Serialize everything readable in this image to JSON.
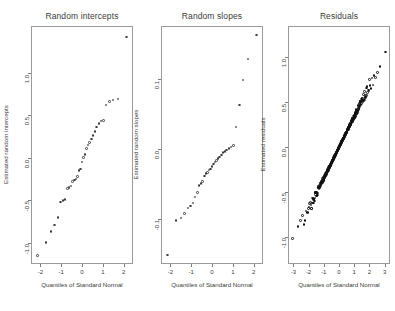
{
  "figure": {
    "background": "#ffffff",
    "point_color": "#3a3a3a",
    "axis_color": "#9a9a9a",
    "text_color": "#3b3b3b",
    "width": 395,
    "height": 311,
    "panel_count": 3
  },
  "chart_data": [
    {
      "type": "scatter",
      "title": "Random intercepts",
      "xlabel": "Quantiles of Standard Normal",
      "ylabel": "Estimated random intercepts",
      "grid": false,
      "legend": "none",
      "xlim": [
        -2.45,
        2.45
      ],
      "ylim": [
        -1.25,
        1.55
      ],
      "xticks": [
        -2,
        -1,
        0,
        1,
        2
      ],
      "xticklabels": [
        "-2",
        "-1",
        "0",
        "1",
        "2"
      ],
      "yticks": [
        -1.0,
        -0.5,
        0.0,
        0.5,
        1.0
      ],
      "yticklabels": [
        "-1.0",
        "-0.5",
        "0.0",
        "0.5",
        "1.0"
      ],
      "x": [
        -2.13,
        -1.73,
        -1.49,
        -1.31,
        -1.16,
        -1.03,
        -0.92,
        -0.81,
        -0.71,
        -0.62,
        -0.53,
        -0.45,
        -0.37,
        -0.29,
        -0.21,
        -0.14,
        -0.07,
        0.0,
        0.07,
        0.14,
        0.21,
        0.29,
        0.37,
        0.45,
        0.53,
        0.62,
        0.71,
        0.81,
        0.92,
        1.03,
        1.16,
        1.31,
        1.49,
        1.73,
        2.13
      ],
      "y": [
        -1.15,
        -1.0,
        -0.87,
        -0.79,
        -0.7,
        -0.52,
        -0.5,
        -0.49,
        -0.36,
        -0.35,
        -0.33,
        -0.28,
        -0.26,
        -0.25,
        -0.22,
        -0.15,
        -0.13,
        -0.05,
        0.0,
        0.04,
        0.11,
        0.15,
        0.18,
        0.22,
        0.26,
        0.31,
        0.36,
        0.4,
        0.43,
        0.44,
        0.62,
        0.66,
        0.68,
        0.69,
        1.42
      ]
    },
    {
      "type": "scatter",
      "title": "Random slopes",
      "xlabel": "Quantiles of Standard Normal",
      "ylabel": "Estimated random slopes",
      "grid": false,
      "legend": "none",
      "xlim": [
        -2.45,
        2.45
      ],
      "ylim": [
        -0.165,
        0.175
      ],
      "xticks": [
        -2,
        -1,
        0,
        1,
        2
      ],
      "xticklabels": [
        "-2",
        "-1",
        "0",
        "1",
        "2"
      ],
      "yticks": [
        -0.1,
        0.0,
        0.1
      ],
      "yticklabels": [
        "-0.1",
        "0.0",
        "0.1"
      ],
      "x": [
        -2.13,
        -1.73,
        -1.49,
        -1.31,
        -1.16,
        -1.03,
        -0.92,
        -0.81,
        -0.71,
        -0.62,
        -0.53,
        -0.45,
        -0.37,
        -0.29,
        -0.21,
        -0.14,
        -0.07,
        0.0,
        0.07,
        0.14,
        0.21,
        0.29,
        0.37,
        0.45,
        0.53,
        0.62,
        0.71,
        0.81,
        0.92,
        1.03,
        1.16,
        1.31,
        1.49,
        1.73,
        2.13
      ],
      "y": [
        -0.152,
        -0.103,
        -0.099,
        -0.093,
        -0.085,
        -0.082,
        -0.078,
        -0.069,
        -0.063,
        -0.053,
        -0.05,
        -0.047,
        -0.039,
        -0.036,
        -0.034,
        -0.031,
        -0.029,
        -0.026,
        -0.022,
        -0.019,
        -0.017,
        -0.014,
        -0.012,
        -0.009,
        -0.006,
        -0.004,
        -0.002,
        0.0,
        0.002,
        0.004,
        0.031,
        0.062,
        0.098,
        0.128,
        0.162
      ]
    },
    {
      "type": "scatter",
      "title": "Residuals",
      "xlabel": "Quantiles of Standard Normal",
      "ylabel": "Estimated residuals",
      "grid": false,
      "legend": "none",
      "point_count": 420,
      "xlim": [
        -3.35,
        3.35
      ],
      "ylim": [
        -1.3,
        1.35
      ],
      "xticks": [
        -3,
        -2,
        -1,
        0,
        1,
        2,
        3
      ],
      "xticklabels": [
        "-3",
        "-2",
        "-1",
        "0",
        "1",
        "2",
        "3"
      ],
      "yticks": [
        -1.0,
        -0.5,
        0.0,
        0.5,
        1.0
      ],
      "yticklabels": [
        "-1.0",
        "-0.5",
        "0.0",
        "0.5",
        "1.0"
      ],
      "slope": 0.345,
      "intercept": 0.0,
      "tail_jitter": 0.045
    }
  ]
}
